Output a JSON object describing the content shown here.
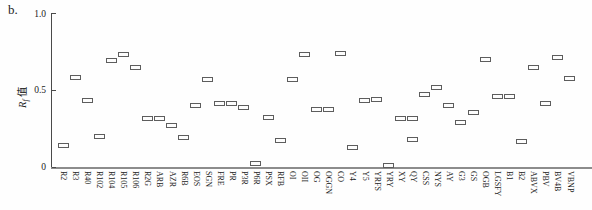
{
  "panel_label": "b.",
  "chart_data": {
    "type": "scatter",
    "marker_shape": "open-rectangle",
    "title": "",
    "xlabel": "",
    "ylabel_main": "R",
    "ylabel_sub": "f",
    "ylabel_suffix": " 值",
    "ylim": [
      0,
      1.0
    ],
    "ytick_labels": [
      "1.0",
      "0.5",
      "0"
    ],
    "ytick_values": [
      1.0,
      0.5,
      0
    ],
    "grid": false,
    "legend": "none",
    "categories": [
      "R2",
      "R3",
      "R40",
      "R102",
      "R104",
      "R105",
      "R106",
      "R2G",
      "ARB",
      "AZR",
      "R6B",
      "EOS",
      "SGN",
      "FRE",
      "PR",
      "P3R",
      "P6R",
      "PSX",
      "RFB",
      "OI",
      "OII",
      "OG",
      "OGGN",
      "CO",
      "Y4",
      "Y5",
      "YRFS",
      "YRY",
      "XY",
      "QY",
      "CSS",
      "NYS",
      "AY",
      "G3",
      "GS",
      "OGB",
      "LGSFY",
      "B1",
      "B2",
      "ABVX",
      "PBV",
      "BV4B",
      "VBNP"
    ],
    "values": [
      [
        0.14
      ],
      [
        0.58
      ],
      [
        0.435
      ],
      [
        0.2
      ],
      [
        0.695
      ],
      [
        0.73
      ],
      [
        0.65
      ],
      [
        0.315
      ],
      [
        0.315
      ],
      [
        0.27
      ],
      [
        0.19
      ],
      [
        0.4
      ],
      [
        0.57
      ],
      [
        0.415
      ],
      [
        0.415
      ],
      [
        0.385
      ],
      [
        0.02
      ],
      [
        0.32
      ],
      [
        0.175
      ],
      [
        0.57
      ],
      [
        0.73
      ],
      [
        0.375
      ],
      [
        0.375
      ],
      [
        0.74
      ],
      [
        0.125
      ],
      [
        0.435
      ],
      [
        0.44
      ],
      [
        0.01
      ],
      [
        0.315
      ],
      [
        0.315,
        0.18
      ],
      [
        0.47
      ],
      [
        0.515
      ],
      [
        0.4
      ],
      [
        0.29
      ],
      [
        0.355
      ],
      [
        0.7
      ],
      [
        0.46
      ],
      [
        0.46
      ],
      [
        0.165
      ],
      [
        0.65
      ],
      [
        0.415
      ],
      [
        0.715
      ],
      [
        0.575
      ]
    ],
    "colors": {
      "marker_border": "#5d5d5d",
      "marker_fill": "#fdfdfd",
      "axis": "#4a4a4a",
      "baseline": "#8c8c8c"
    }
  }
}
